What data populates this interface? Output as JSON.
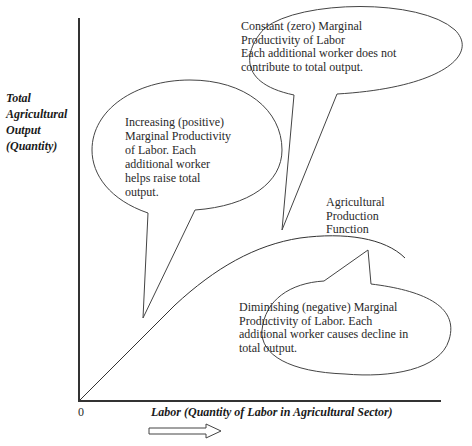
{
  "diagram": {
    "title": "Agricultural Production Function",
    "y_axis_label": [
      "Total",
      "Agricultural",
      "Output",
      "(Quantity)"
    ],
    "x_axis_label": "Labor (Quantity of Labor in Agricultural Sector)",
    "origin_label": "0",
    "curve_label": [
      "Agricultural",
      "Production",
      "Function"
    ],
    "callouts": {
      "increasing": [
        "Increasing (positive)",
        "Marginal Productivity",
        "of Labor. Each",
        "additional worker",
        "helps raise total",
        "output."
      ],
      "constant": [
        "Constant (zero) Marginal",
        "Productivity of Labor",
        "Each additional worker does not",
        "contribute to total output."
      ],
      "diminishing": [
        "Diminishing (negative) Marginal",
        "Productivity of Labor. Each",
        "additional worker causes decline in",
        "total output."
      ]
    },
    "arrow_direction": "right",
    "colors": {
      "line": "#333333",
      "text": "#2a2a2a",
      "background": "#ffffff"
    }
  }
}
